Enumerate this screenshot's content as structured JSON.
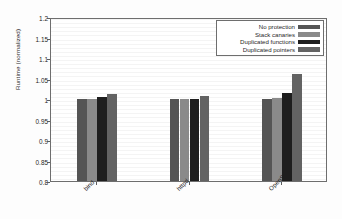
{
  "chart_data": {
    "type": "bar",
    "title": "",
    "xlabel": "",
    "ylabel": "Runtime (normalized)",
    "ylim": [
      0.8,
      1.2
    ],
    "yticks": [
      "0.8",
      "0.85",
      "0.9",
      "0.95",
      "1",
      "1.05",
      "1.1",
      "1.15",
      "1.2"
    ],
    "ytick_values": [
      0.8,
      0.85,
      0.9,
      0.95,
      1.0,
      1.05,
      1.1,
      1.15,
      1.2
    ],
    "grid": true,
    "legend_position": "top-right",
    "categories": [
      "bind",
      "httpd",
      "OpenSSH"
    ],
    "series": [
      {
        "name": "No protection",
        "color": "#555555",
        "values": [
          1.0,
          1.0,
          1.0
        ]
      },
      {
        "name": "Stack canaries",
        "color": "#8a8a8a",
        "values": [
          1.0,
          1.001,
          1.003
        ]
      },
      {
        "name": "Duplicated functions",
        "color": "#1e1e1e",
        "values": [
          1.004,
          1.0,
          1.014
        ]
      },
      {
        "name": "Duplicated pointers",
        "color": "#636363",
        "values": [
          1.013,
          1.008,
          1.06
        ]
      }
    ]
  },
  "legend": {
    "entries": [
      {
        "label": "No protection"
      },
      {
        "label": "Stack canaries"
      },
      {
        "label": "Duplicated functions"
      },
      {
        "label": "Duplicated pointers"
      }
    ]
  }
}
